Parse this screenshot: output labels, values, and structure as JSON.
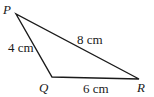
{
  "diagram": {
    "type": "triangle",
    "vertices": [
      {
        "name": "P",
        "x": 16,
        "y": 14,
        "label_x": 3,
        "label_y": 14
      },
      {
        "name": "Q",
        "x": 52,
        "y": 77,
        "label_x": 39,
        "label_y": 92
      },
      {
        "name": "R",
        "x": 139,
        "y": 79,
        "label_x": 137,
        "label_y": 92
      }
    ],
    "sides": [
      {
        "from": "P",
        "to": "R",
        "label": "8 cm",
        "label_x": 77,
        "label_y": 44
      },
      {
        "from": "P",
        "to": "Q",
        "label": "4 cm",
        "label_x": 8,
        "label_y": 52
      },
      {
        "from": "Q",
        "to": "R",
        "label": "6 cm",
        "label_x": 83,
        "label_y": 93
      }
    ],
    "stroke_color": "#1a1a1a"
  }
}
